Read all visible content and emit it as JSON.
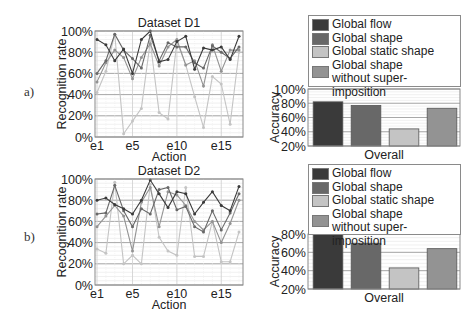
{
  "panels": [
    {
      "label": "a)"
    },
    {
      "label": "b)"
    }
  ],
  "legend": {
    "items": [
      {
        "label": "Global flow",
        "color": "#3a3a3a"
      },
      {
        "label": "Global shape",
        "color": "#686868"
      },
      {
        "label": "Global static shape",
        "color": "#c4c4c4"
      },
      {
        "label": "Global shape",
        "label2": "without super-imposition",
        "color": "#939393"
      }
    ]
  },
  "chart_data": [
    {
      "type": "line",
      "title": "Dataset D1",
      "xlabel": "Action",
      "ylabel": "Recognition rate",
      "ylim": [
        0,
        100
      ],
      "yticks": [
        "0%",
        "20%",
        "40%",
        "60%",
        "80%",
        "100%"
      ],
      "xticks": [
        "e1",
        "e5",
        "e10",
        "e15"
      ],
      "x": [
        "e1",
        "e2",
        "e3",
        "e4",
        "e5",
        "e6",
        "e7",
        "e8",
        "e9",
        "e10",
        "e11",
        "e12",
        "e13",
        "e14",
        "e15",
        "e16",
        "e17"
      ],
      "grid": true,
      "series": [
        {
          "name": "Global flow",
          "values": [
            92,
            87,
            72,
            83,
            60,
            92,
            100,
            71,
            73,
            90,
            95,
            64,
            84,
            82,
            85,
            73,
            95
          ]
        },
        {
          "name": "Global shape",
          "values": [
            60,
            72,
            97,
            82,
            74,
            65,
            96,
            72,
            89,
            85,
            85,
            70,
            65,
            86,
            80,
            74,
            85
          ]
        },
        {
          "name": "Global static shape",
          "values": [
            42,
            62,
            97,
            3,
            15,
            27,
            90,
            23,
            17,
            90,
            68,
            38,
            9,
            57,
            50,
            12,
            80
          ]
        },
        {
          "name": "Global shape without super-imposition",
          "values": [
            52,
            70,
            82,
            75,
            55,
            75,
            88,
            67,
            85,
            92,
            68,
            72,
            48,
            87,
            62,
            82,
            82
          ]
        }
      ]
    },
    {
      "type": "bar",
      "title": "",
      "xlabel": "Overall",
      "ylabel": "Accuracy",
      "ylim": [
        20,
        100
      ],
      "yticks": [
        "20%",
        "40%",
        "60%",
        "80%",
        "100%"
      ],
      "categories": [
        "Global flow",
        "Global shape",
        "Global static shape",
        "Global shape without super-imposition"
      ],
      "values": [
        82,
        77,
        44,
        73
      ]
    },
    {
      "type": "line",
      "title": "Dataset D2",
      "xlabel": "Action",
      "ylabel": "Recognition rate",
      "ylim": [
        0,
        100
      ],
      "yticks": [
        "0%",
        "20%",
        "40%",
        "60%",
        "80%",
        "100%"
      ],
      "xticks": [
        "e1",
        "e5",
        "e10",
        "e15"
      ],
      "x": [
        "e1",
        "e2",
        "e3",
        "e4",
        "e5",
        "e6",
        "e7",
        "e8",
        "e9",
        "e10",
        "e11",
        "e12",
        "e13",
        "e14",
        "e15",
        "e16",
        "e17"
      ],
      "grid": true,
      "series": [
        {
          "name": "Global flow",
          "values": [
            80,
            82,
            76,
            72,
            67,
            80,
            99,
            86,
            73,
            88,
            86,
            67,
            78,
            88,
            75,
            70,
            93
          ]
        },
        {
          "name": "Global shape",
          "values": [
            67,
            68,
            94,
            70,
            55,
            72,
            67,
            90,
            92,
            71,
            74,
            55,
            50,
            70,
            52,
            68,
            86
          ]
        },
        {
          "name": "Global static shape",
          "values": [
            34,
            30,
            97,
            20,
            28,
            20,
            95,
            45,
            32,
            28,
            92,
            27,
            27,
            60,
            22,
            22,
            50
          ]
        },
        {
          "name": "Global shape without super-imposition",
          "values": [
            55,
            65,
            75,
            65,
            32,
            78,
            92,
            55,
            88,
            85,
            75,
            60,
            52,
            60,
            40,
            58,
            80
          ]
        }
      ]
    },
    {
      "type": "bar",
      "title": "",
      "xlabel": "Overall",
      "ylabel": "Accuracy",
      "ylim": [
        20,
        80
      ],
      "yticks": [
        "20%",
        "40%",
        "60%",
        "80%"
      ],
      "categories": [
        "Global flow",
        "Global shape",
        "Global static shape",
        "Global shape without super-imposition"
      ],
      "values": [
        80,
        70,
        43,
        64
      ]
    }
  ]
}
